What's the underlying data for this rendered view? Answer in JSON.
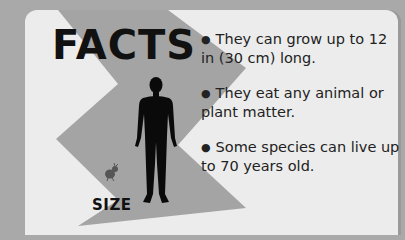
{
  "header": {
    "title": "FACTS"
  },
  "illustration": {
    "size_label": "SIZE",
    "large_figure": "human-silhouette-icon",
    "small_figure": "cockroach-icon"
  },
  "facts": [
    {
      "bullet": "●",
      "text": "They can grow up to 12 in (30 cm) long."
    },
    {
      "bullet": "●",
      "text": "They eat any animal or plant matter."
    },
    {
      "bullet": "●",
      "text": "Some species can live up to 70 years old."
    }
  ],
  "colors": {
    "background": "#a9a9a9",
    "panel": "#ececec",
    "zigzag": "#a4a4a4",
    "text": "#111111"
  }
}
